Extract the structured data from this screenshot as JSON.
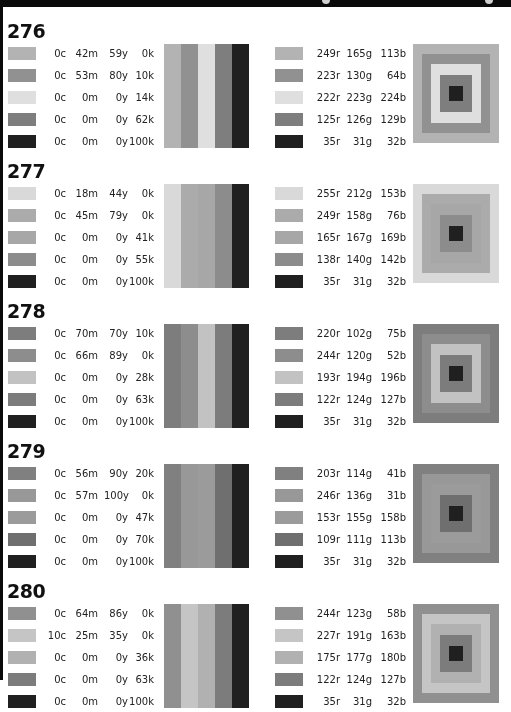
{
  "header": {
    "visible_fragment": "cropped title bar"
  },
  "sections": [
    {
      "id": "276",
      "rows": [
        {
          "c": "0c",
          "m": "42m",
          "y": "59y",
          "k": "0k",
          "r": "249r",
          "g": "165g",
          "b": "113b",
          "hex": "#f9a571"
        },
        {
          "c": "0c",
          "m": "53m",
          "y": "80y",
          "k": "10k",
          "r": "223r",
          "g": "130g",
          "b": "64b",
          "hex": "#df8240"
        },
        {
          "c": "0c",
          "m": "0m",
          "y": "0y",
          "k": "14k",
          "r": "222r",
          "g": "223g",
          "b": "224b",
          "hex": "#dedfe0"
        },
        {
          "c": "0c",
          "m": "0m",
          "y": "0y",
          "k": "62k",
          "r": "125r",
          "g": "126g",
          "b": "129b",
          "hex": "#7d7e81"
        },
        {
          "c": "0c",
          "m": "0m",
          "y": "0y",
          "k": "100k",
          "r": "35r",
          "g": "31g",
          "b": "32b",
          "hex": "#231f20"
        }
      ]
    },
    {
      "id": "277",
      "rows": [
        {
          "c": "0c",
          "m": "18m",
          "y": "44y",
          "k": "0k",
          "r": "255r",
          "g": "212g",
          "b": "153b",
          "hex": "#ffd499"
        },
        {
          "c": "0c",
          "m": "45m",
          "y": "79y",
          "k": "0k",
          "r": "249r",
          "g": "158g",
          "b": "76b",
          "hex": "#f99e4c"
        },
        {
          "c": "0c",
          "m": "0m",
          "y": "0y",
          "k": "41k",
          "r": "165r",
          "g": "167g",
          "b": "169b",
          "hex": "#a5a7a9"
        },
        {
          "c": "0c",
          "m": "0m",
          "y": "0y",
          "k": "55k",
          "r": "138r",
          "g": "140g",
          "b": "142b",
          "hex": "#8a8c8e"
        },
        {
          "c": "0c",
          "m": "0m",
          "y": "0y",
          "k": "100k",
          "r": "35r",
          "g": "31g",
          "b": "32b",
          "hex": "#231f20"
        }
      ]
    },
    {
      "id": "278",
      "rows": [
        {
          "c": "0c",
          "m": "70m",
          "y": "70y",
          "k": "10k",
          "r": "220r",
          "g": "102g",
          "b": "75b",
          "hex": "#dc664b"
        },
        {
          "c": "0c",
          "m": "66m",
          "y": "89y",
          "k": "0k",
          "r": "244r",
          "g": "120g",
          "b": "52b",
          "hex": "#f47834"
        },
        {
          "c": "0c",
          "m": "0m",
          "y": "0y",
          "k": "28k",
          "r": "193r",
          "g": "194g",
          "b": "196b",
          "hex": "#c1c2c4"
        },
        {
          "c": "0c",
          "m": "0m",
          "y": "0y",
          "k": "63k",
          "r": "122r",
          "g": "124g",
          "b": "127b",
          "hex": "#7a7c7f"
        },
        {
          "c": "0c",
          "m": "0m",
          "y": "0y",
          "k": "100k",
          "r": "35r",
          "g": "31g",
          "b": "32b",
          "hex": "#231f20"
        }
      ]
    },
    {
      "id": "279",
      "rows": [
        {
          "c": "0c",
          "m": "56m",
          "y": "90y",
          "k": "20k",
          "r": "203r",
          "g": "114g",
          "b": "41b",
          "hex": "#cb7229"
        },
        {
          "c": "0c",
          "m": "57m",
          "y": "100y",
          "k": "0k",
          "r": "246r",
          "g": "136g",
          "b": "31b",
          "hex": "#f6881f"
        },
        {
          "c": "0c",
          "m": "0m",
          "y": "0y",
          "k": "47k",
          "r": "153r",
          "g": "155g",
          "b": "158b",
          "hex": "#999b9e"
        },
        {
          "c": "0c",
          "m": "0m",
          "y": "0y",
          "k": "70k",
          "r": "109r",
          "g": "111g",
          "b": "113b",
          "hex": "#6d6f71"
        },
        {
          "c": "0c",
          "m": "0m",
          "y": "0y",
          "k": "100k",
          "r": "35r",
          "g": "31g",
          "b": "32b",
          "hex": "#231f20"
        }
      ]
    },
    {
      "id": "280",
      "rows": [
        {
          "c": "0c",
          "m": "64m",
          "y": "86y",
          "k": "0k",
          "r": "244r",
          "g": "123g",
          "b": "58b",
          "hex": "#f47b3a"
        },
        {
          "c": "10c",
          "m": "25m",
          "y": "35y",
          "k": "0k",
          "r": "227r",
          "g": "191g",
          "b": "163b",
          "hex": "#e3bfa3"
        },
        {
          "c": "0c",
          "m": "0m",
          "y": "0y",
          "k": "36k",
          "r": "175r",
          "g": "177g",
          "b": "180b",
          "hex": "#afb1b4"
        },
        {
          "c": "0c",
          "m": "0m",
          "y": "0y",
          "k": "63k",
          "r": "122r",
          "g": "124g",
          "b": "127b",
          "hex": "#7a7c7f"
        },
        {
          "c": "0c",
          "m": "0m",
          "y": "0y",
          "k": "100k",
          "r": "35r",
          "g": "31g",
          "b": "32b",
          "hex": "#231f20"
        }
      ]
    }
  ]
}
